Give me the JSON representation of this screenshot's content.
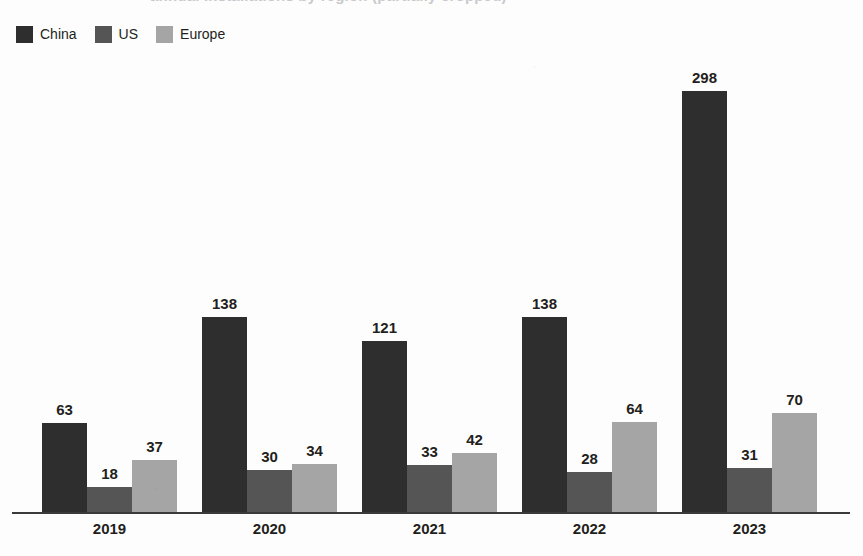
{
  "title_cutoff": "annual installations by region (partially cropped)",
  "legend": {
    "items": [
      {
        "label": "China",
        "color": "#2e2e2e",
        "swatch_icon": "legend-swatch-icon"
      },
      {
        "label": "US",
        "color": "#555555",
        "swatch_icon": "legend-swatch-icon"
      },
      {
        "label": "Europe",
        "color": "#a5a5a5",
        "swatch_icon": "legend-swatch-icon"
      }
    ]
  },
  "chart_data": {
    "type": "bar",
    "title": "",
    "xlabel": "",
    "ylabel": "",
    "grid": false,
    "legend_position": "top-left",
    "ylim": [
      0,
      310
    ],
    "categories": [
      "2019",
      "2020",
      "2021",
      "2022",
      "2023"
    ],
    "series": [
      {
        "name": "China",
        "color": "#2e2e2e",
        "values": [
          63,
          138,
          121,
          138,
          298
        ]
      },
      {
        "name": "US",
        "color": "#555555",
        "values": [
          18,
          30,
          33,
          28,
          31
        ]
      },
      {
        "name": "Europe",
        "color": "#a5a5a5",
        "values": [
          37,
          34,
          42,
          64,
          70
        ]
      }
    ],
    "data_labels": {
      "2019": {
        "China": "63",
        "US": "18",
        "Europe": "37"
      },
      "2020": {
        "China": "138",
        "US": "30",
        "Europe": "34"
      },
      "2021": {
        "China": "121",
        "US": "33",
        "Europe": "42"
      },
      "2022": {
        "China": "138",
        "US": "28",
        "Europe": "64"
      },
      "2023": {
        "China": "298",
        "US": "31",
        "Europe": "70"
      }
    }
  },
  "geometry": {
    "baseline_y": 512,
    "px_per_unit": 1.414,
    "bar_width": 45,
    "group_pitch": 160,
    "first_group_left": 42
  }
}
